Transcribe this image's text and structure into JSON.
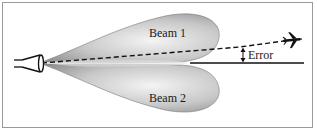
{
  "diagram": {
    "title": "",
    "beams": [
      {
        "label": "Beam 1",
        "position": "upper"
      },
      {
        "label": "Beam 2",
        "position": "lower"
      }
    ],
    "error_label": "Error",
    "icons": {
      "antenna": "antenna-horn-icon",
      "target": "airplane-icon"
    },
    "colors": {
      "frame": "#9a9a9a",
      "lobe_dark": "#8c8c8c",
      "lobe_light": "#f2f2f2",
      "line": "#111111"
    }
  }
}
